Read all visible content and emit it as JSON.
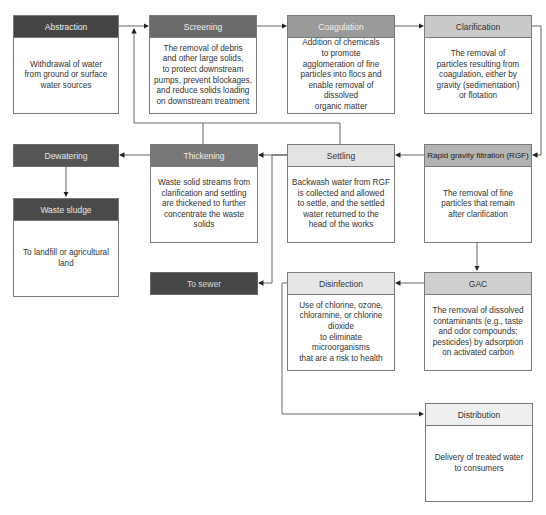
{
  "colors": {
    "dark": "#444444",
    "medium_dark": "#6b6b6b",
    "medium": "#9a9a9a",
    "light": "#c9c9c9",
    "very_light": "#e3e3e3",
    "lightest": "#efefef",
    "line": "#555555"
  },
  "nodes": {
    "abstraction": {
      "title": "Abstraction",
      "desc": [
        "Withdrawal of water",
        "from ground or surface",
        "water sources"
      ]
    },
    "screening": {
      "title": "Screening",
      "desc": [
        "The removal of debris",
        "and other large solids,",
        "to protect downstream",
        "pumps, prevent blockages,",
        "and reduce solids loading",
        "on downstream treatment"
      ]
    },
    "coagulation": {
      "title": "Coagulation",
      "desc": [
        "Addition of chemicals",
        "to promote",
        "agglomeration of fine",
        "particles into flocs and",
        "enable removal of dissolved",
        "organic matter"
      ]
    },
    "clarification": {
      "title": "Clarification",
      "desc": [
        "The removal of",
        "particles resulting from",
        "coagulation, either by",
        "gravity (sedimentation)",
        "or flotation"
      ]
    },
    "dewatering": {
      "title": "Dewatering"
    },
    "thickening": {
      "title": "Thickening",
      "desc": [
        "Waste solid streams from",
        "clarification and settling",
        "are thickened to further",
        "concentrate the waste solids"
      ]
    },
    "settling": {
      "title": "Settling",
      "desc": [
        "Backwash water from RGF",
        "is collected and allowed",
        "to settle, and the settled",
        "water returned to the",
        "head of the works"
      ]
    },
    "rgf": {
      "title": "Rapid gravity filtration (RGF)",
      "desc": [
        "The removal of fine",
        "particles that remain",
        "after clarification"
      ]
    },
    "waste_sludge": {
      "title": "Waste sludge",
      "desc": [
        "To landfill or agricultural",
        "land"
      ]
    },
    "to_sewer": {
      "title": "To sewer"
    },
    "disinfection": {
      "title": "Disinfection",
      "desc": [
        "Use of chlorine, ozone,",
        "chloramine, or chlorine dioxide",
        "to eliminate microorganisms",
        "that are a risk to health"
      ]
    },
    "gac": {
      "title": "GAC",
      "desc": [
        "The removal of dissolved",
        "contaminants (e.g., taste",
        "and odor compounds;",
        "pesticides) by adsorption",
        "on activated carbon"
      ]
    },
    "distribution": {
      "title": "Distribution",
      "desc": [
        "Delivery of treated water",
        "to consumers"
      ]
    }
  },
  "edges": [
    [
      "Abstraction",
      "Screening"
    ],
    [
      "Screening",
      "Coagulation"
    ],
    [
      "Coagulation",
      "Clarification"
    ],
    [
      "Clarification",
      "Rapid gravity filtration (RGF)"
    ],
    [
      "Clarification",
      "Thickening"
    ],
    [
      "Rapid gravity filtration (RGF)",
      "Settling"
    ],
    [
      "Settling",
      "Thickening"
    ],
    [
      "Settling",
      "Screening"
    ],
    [
      "Thickening",
      "Screening"
    ],
    [
      "Thickening",
      "Dewatering"
    ],
    [
      "Dewatering",
      "Waste sludge"
    ],
    [
      "Thickening",
      "To sewer"
    ],
    [
      "Rapid gravity filtration (RGF)",
      "GAC"
    ],
    [
      "GAC",
      "Disinfection"
    ],
    [
      "Disinfection",
      "Distribution"
    ]
  ]
}
